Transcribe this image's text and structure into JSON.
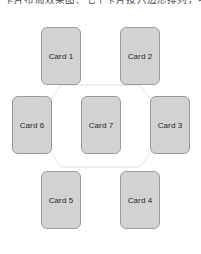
{
  "caption": {
    "text": "卡片布局效果图：七个卡片按六边形排列，中间为第七张卡片"
  },
  "colors": {
    "background": "#ffffff",
    "card_fill": "#d2d2d2",
    "card_border": "#9a9a9a",
    "card_text": "#262626",
    "hex_line": "#e2e2e2"
  },
  "diagram": {
    "type": "hexagon-card-layout",
    "center_card": "Card 7",
    "outer_cards": [
      "Card 1",
      "Card 2",
      "Card 3",
      "Card 4",
      "Card 5",
      "Card 6"
    ],
    "cards": [
      {
        "label": "Card 1",
        "x": 41,
        "y": 27,
        "position": "top-left"
      },
      {
        "label": "Card 2",
        "x": 120,
        "y": 27,
        "position": "top-right"
      },
      {
        "label": "Card 6",
        "x": 12,
        "y": 96,
        "position": "middle-left"
      },
      {
        "label": "Card 7",
        "x": 81,
        "y": 96,
        "position": "center"
      },
      {
        "label": "Card 3",
        "x": 150,
        "y": 96,
        "position": "middle-right"
      },
      {
        "label": "Card 5",
        "x": 41,
        "y": 171,
        "position": "bottom-left"
      },
      {
        "label": "Card 4",
        "x": 120,
        "y": 171,
        "position": "bottom-right"
      }
    ],
    "hex_path": "M 61,85 L 32,126 L 61,167 L 140,167 L 169,126 L 140,85 Z"
  }
}
